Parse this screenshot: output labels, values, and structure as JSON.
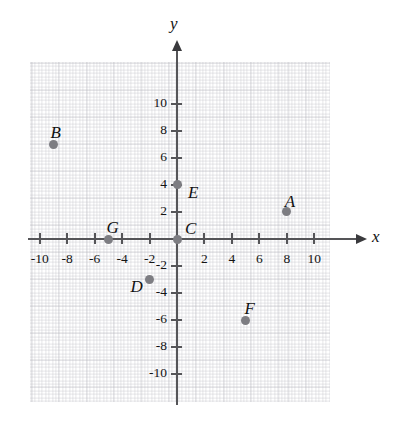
{
  "chart_data": {
    "type": "scatter",
    "title": "",
    "xlabel": "x",
    "ylabel": "y",
    "xlim": [
      -11,
      11
    ],
    "ylim": [
      -11,
      11
    ],
    "grid": true,
    "legend": "none",
    "x_ticks": [
      -10,
      -8,
      -6,
      -4,
      -2,
      2,
      4,
      6,
      8,
      10
    ],
    "y_ticks": [
      10,
      8,
      6,
      4,
      2,
      -2,
      -4,
      -6,
      -8,
      -10
    ],
    "x_tick_labels": [
      "-10",
      "-8",
      "-6",
      "-4",
      "-2",
      "2",
      "4",
      "6",
      "8",
      "10"
    ],
    "y_tick_labels": [
      "10",
      "8",
      "6",
      "4",
      "2",
      "-2",
      "-4",
      "-6",
      "-8",
      "-10"
    ],
    "points": [
      {
        "label": "A",
        "x": 8,
        "y": 2,
        "label_dx": -2,
        "label_dy": -20
      },
      {
        "label": "B",
        "x": -9,
        "y": 7,
        "label_dx": -3,
        "label_dy": -21
      },
      {
        "label": "C",
        "x": 0,
        "y": 0,
        "label_dx": 8,
        "label_dy": -20
      },
      {
        "label": "D",
        "x": -2,
        "y": -3,
        "label_dx": -19,
        "label_dy": -3
      },
      {
        "label": "E",
        "x": 0,
        "y": 4,
        "label_dx": 11,
        "label_dy": -2
      },
      {
        "label": "F",
        "x": 5,
        "y": -6,
        "label_dx": -1,
        "label_dy": -21
      },
      {
        "label": "G",
        "x": -5,
        "y": 0,
        "label_dx": -2,
        "label_dy": -21
      }
    ],
    "point_color": "#7d7d82",
    "axis_color": "#555558",
    "grid_color": "#aaaab4"
  }
}
